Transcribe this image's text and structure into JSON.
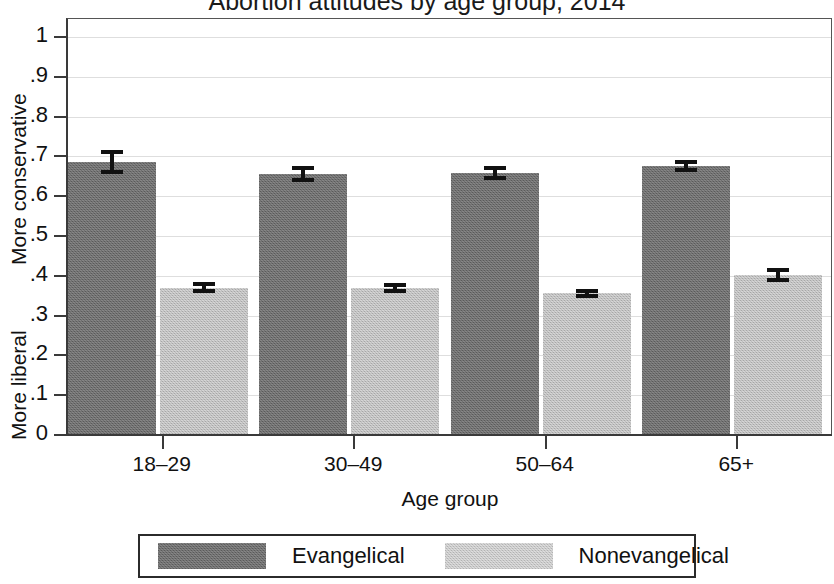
{
  "chart_data": {
    "type": "bar",
    "title": "Abortion attitudes by age group, 2014",
    "xlabel": "Age group",
    "ylabel_top": "More conservative",
    "ylabel_bottom": "More liberal",
    "categories": [
      "18–29",
      "30–49",
      "50–64",
      "65+"
    ],
    "ylim": [
      0,
      1
    ],
    "yticks": [
      "0",
      ".1",
      ".2",
      ".3",
      ".4",
      ".5",
      ".6",
      ".7",
      ".8",
      ".9",
      "1"
    ],
    "ytick_values": [
      0,
      0.1,
      0.2,
      0.3,
      0.4,
      0.5,
      0.6,
      0.7,
      0.8,
      0.9,
      1
    ],
    "grid": true,
    "legend_position": "bottom",
    "series": [
      {
        "name": "Evangelical",
        "color": "#6e6e6e",
        "values": [
          0.685,
          0.656,
          0.658,
          0.676
        ],
        "errors_low": [
          0.655,
          0.635,
          0.64,
          0.66
        ],
        "errors_high": [
          0.715,
          0.677,
          0.676,
          0.692
        ]
      },
      {
        "name": "Nonevangelical",
        "color": "#bdbdbd",
        "values": [
          0.37,
          0.369,
          0.356,
          0.402
        ],
        "errors_low": [
          0.356,
          0.356,
          0.345,
          0.385
        ],
        "errors_high": [
          0.384,
          0.382,
          0.367,
          0.419
        ]
      }
    ]
  },
  "legend": {
    "entries": [
      {
        "label": "Evangelical"
      },
      {
        "label": "Nonevangelical"
      }
    ]
  },
  "colors": {
    "evangelical": "#6e6e6e",
    "nonevangelical": "#bdbdbd",
    "axis": "#3a3a3a",
    "grid": "#dedede",
    "background": "#ffffff"
  }
}
